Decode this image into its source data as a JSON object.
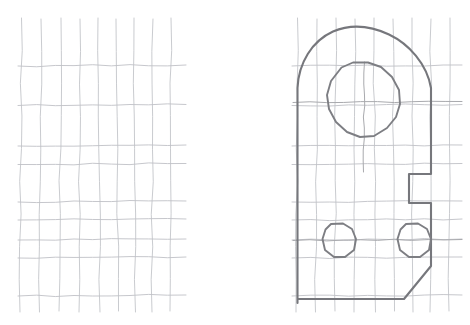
{
  "page": {
    "background_color": "#ffffff",
    "width": 470,
    "height": 325
  },
  "colors": {
    "grid_line": "#c3c5c9",
    "grid_line_horizontal": "#bfc1c6",
    "outline": "#76777c",
    "hole": "#7d7e83",
    "center_line": "#a9aaae",
    "paper": "#ffffff"
  },
  "panels": [
    {
      "id": "left-grid-panel",
      "label": "Blank graph paper grid",
      "origin_x": 20,
      "origin_y": 18,
      "columns": 9,
      "rows": 9,
      "cell_width": 18.5,
      "cell_height": 32.5
    },
    {
      "id": "right-drawing-panel",
      "label": "Bracket plate outline drawing",
      "origin_x": 296,
      "origin_y": 18,
      "columns": 9,
      "rows": 9,
      "cell_width": 18.5,
      "cell_height": 32.5
    }
  ],
  "left_grid": {
    "name": "empty-grid",
    "vertical_lines": [
      {
        "x_top": 21.5,
        "x_bottom": 20.0,
        "y_top": 18,
        "y_bottom": 312
      },
      {
        "x_top": 41.0,
        "x_bottom": 39.5,
        "y_top": 19,
        "y_bottom": 312
      },
      {
        "x_top": 61.0,
        "x_bottom": 59.0,
        "y_top": 18,
        "y_bottom": 311
      },
      {
        "x_top": 80.0,
        "x_bottom": 79.0,
        "y_top": 19,
        "y_bottom": 312
      },
      {
        "x_top": 98.0,
        "x_bottom": 100.0,
        "y_top": 18,
        "y_bottom": 312
      },
      {
        "x_top": 116.0,
        "x_bottom": 118.5,
        "y_top": 19,
        "y_bottom": 311
      },
      {
        "x_top": 134.0,
        "x_bottom": 135.5,
        "y_top": 18,
        "y_bottom": 312
      },
      {
        "x_top": 153.0,
        "x_bottom": 152.0,
        "y_top": 19,
        "y_bottom": 312
      },
      {
        "x_top": 171.0,
        "x_bottom": 170.0,
        "y_top": 18,
        "y_bottom": 311
      }
    ],
    "horizontal_lines": [
      {
        "y_left": 66.0,
        "y_right": 65.0,
        "x_left": 18,
        "x_bottom": 186
      },
      {
        "y_left": 105.5,
        "y_right": 104.5,
        "x_left": 18,
        "x_bottom": 186
      },
      {
        "y_left": 146.0,
        "y_right": 145.0,
        "x_left": 18,
        "x_bottom": 186
      },
      {
        "y_left": 164.5,
        "y_right": 163.5,
        "x_left": 18,
        "x_bottom": 186
      },
      {
        "y_left": 202.0,
        "y_right": 201.0,
        "x_left": 18,
        "x_bottom": 186
      },
      {
        "y_left": 220.0,
        "y_right": 219.0,
        "x_left": 18,
        "x_bottom": 186
      },
      {
        "y_left": 240.0,
        "y_right": 239.0,
        "x_left": 18,
        "x_bottom": 186
      },
      {
        "y_left": 258.0,
        "y_right": 257.0,
        "x_left": 18,
        "x_bottom": 186
      },
      {
        "y_left": 296.0,
        "y_right": 295.0,
        "x_left": 18,
        "x_bottom": 186
      }
    ]
  },
  "right_grid": {
    "name": "drawing-grid",
    "vertical_lines": [
      {
        "x_top": 297.5,
        "x_bottom": 296.0,
        "y_top": 18,
        "y_bottom": 312
      },
      {
        "x_top": 317.0,
        "x_bottom": 315.5,
        "y_top": 19,
        "y_bottom": 312
      },
      {
        "x_top": 336.0,
        "x_bottom": 335.0,
        "y_top": 18,
        "y_bottom": 311
      },
      {
        "x_top": 355.0,
        "x_bottom": 354.0,
        "y_top": 19,
        "y_bottom": 312
      },
      {
        "x_top": 374.0,
        "x_bottom": 375.5,
        "y_top": 18,
        "y_bottom": 312
      },
      {
        "x_top": 393.0,
        "x_bottom": 394.5,
        "y_top": 19,
        "y_bottom": 311
      },
      {
        "x_top": 412.0,
        "x_bottom": 413.0,
        "y_top": 18,
        "y_bottom": 312
      },
      {
        "x_top": 431.0,
        "x_bottom": 430.0,
        "y_top": 19,
        "y_bottom": 312
      },
      {
        "x_top": 450.0,
        "x_bottom": 449.0,
        "y_top": 18,
        "y_bottom": 311
      }
    ],
    "horizontal_lines": [
      {
        "y_left": 66.0,
        "y_right": 65.0
      },
      {
        "y_left": 105.5,
        "y_right": 104.5
      },
      {
        "y_left": 146.0,
        "y_right": 145.0
      },
      {
        "y_left": 164.5,
        "y_right": 163.5
      },
      {
        "y_left": 202.0,
        "y_right": 201.0
      },
      {
        "y_left": 220.0,
        "y_right": 219.0
      },
      {
        "y_left": 240.0,
        "y_right": 239.0
      },
      {
        "y_left": 258.0,
        "y_right": 257.0
      },
      {
        "y_left": 296.0,
        "y_right": 295.0
      }
    ],
    "x_left": 292,
    "x_right": 462
  },
  "drawing": {
    "name": "bracket-plate",
    "description": "Plate with rounded top, one large central hole, two small holes, a rectangular notch on the right edge and a chamfered bottom-right corner",
    "outline_path": "M 297.5 303 L 297.5 88 C 298.5 63 312 41 333 31.5 C 352 23.5 372 26.5 389 34.5 C 409 44 427 64 431 88 L 431 174 L 409 174 L 409 203 L 431 203 L 431 266 L 404 299 L 297.5 299 Z",
    "features": [
      {
        "name": "rounded-top-arc",
        "type": "arc",
        "description": "Rounded dome top spanning the full plate width",
        "peak": {
          "x": 370,
          "y": 27
        },
        "left_tangent": {
          "x": 297.5,
          "y": 88
        },
        "right_tangent": {
          "x": 431,
          "y": 88
        }
      },
      {
        "name": "left-edge",
        "type": "line",
        "from": {
          "x": 297.5,
          "y": 88
        },
        "to": {
          "x": 297.5,
          "y": 303
        }
      },
      {
        "name": "right-edge-upper",
        "type": "line",
        "from": {
          "x": 431,
          "y": 88
        },
        "to": {
          "x": 431,
          "y": 174
        }
      },
      {
        "name": "notch",
        "type": "rectangular-cutout",
        "description": "Rectangular notch cut into the right edge",
        "top": {
          "x_start": 431,
          "x_end": 409,
          "y": 174
        },
        "inner_edge": {
          "x": 409,
          "y_start": 174,
          "y_end": 203
        },
        "bottom": {
          "x_start": 409,
          "x_end": 431,
          "y": 203
        },
        "width": 22,
        "height": 29
      },
      {
        "name": "right-edge-lower",
        "type": "line",
        "from": {
          "x": 431,
          "y": 203
        },
        "to": {
          "x": 431,
          "y": 266
        }
      },
      {
        "name": "chamfer",
        "type": "diagonal",
        "description": "Chamfered bottom right corner",
        "from": {
          "x": 431,
          "y": 266
        },
        "to": {
          "x": 404,
          "y": 299
        }
      },
      {
        "name": "bottom-edge",
        "type": "line",
        "from": {
          "x": 404,
          "y": 299
        },
        "to": {
          "x": 297.5,
          "y": 299
        }
      }
    ],
    "holes": [
      {
        "name": "large-center-hole",
        "shape": "polygon-circle",
        "center": {
          "x": 364,
          "y": 102
        },
        "radius": 40,
        "sides": 12,
        "path": "M 341.5 67.5 L 353 62.5 L 368 62.5 L 381 67 L 392 77 L 399 90 L 400 104 L 396 117 L 387 128 L 374 136 L 360 137 L 347 132 L 336 122 L 329 109 L 327 95 L 331 81 Z"
      },
      {
        "name": "small-hole-left",
        "shape": "polygon-circle",
        "center": {
          "x": 339,
          "y": 240
        },
        "radius": 17,
        "sides": 10,
        "path": "M 331 224 L 343 223.5 L 352 229 L 356 239 L 354 250 L 345 257 L 334 257 L 325 250 L 322.5 239 L 325.5 229.5 Z"
      },
      {
        "name": "small-hole-right",
        "shape": "polygon-circle",
        "center": {
          "x": 414,
          "y": 240
        },
        "radius": 17,
        "sides": 10,
        "path": "M 406 224 L 418 223.5 L 427 229 L 431 239 L 429 250 L 420 257 L 409 257 L 400 250 L 397.5 239 L 400.5 229.5 Z"
      }
    ],
    "center_lines": [
      {
        "name": "horizontal-centerline-large-hole",
        "orientation": "horizontal",
        "from": {
          "x": 293,
          "y": 102.5
        },
        "to": {
          "x": 462,
          "y": 101.5
        }
      },
      {
        "name": "vertical-centerline-large-hole",
        "orientation": "vertical",
        "from": {
          "x": 364.5,
          "y": 62
        },
        "to": {
          "x": 363.5,
          "y": 172
        }
      },
      {
        "name": "horizontal-centerline-small-holes",
        "orientation": "horizontal",
        "from": {
          "x": 293,
          "y": 240.5
        },
        "to": {
          "x": 462,
          "y": 239.5
        }
      }
    ]
  }
}
